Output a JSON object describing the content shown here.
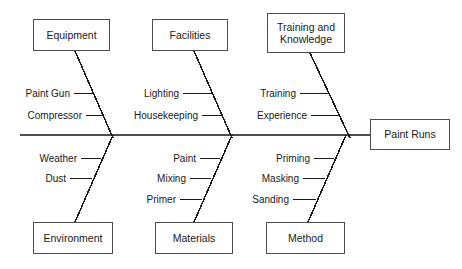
{
  "diagram": {
    "type": "fishbone-ishikawa",
    "effect": {
      "label": "Paint Runs"
    },
    "spine": {
      "x_start": 20,
      "x_end": 370,
      "y": 135
    },
    "colors": {
      "line": "#4d4d4d",
      "bone": "#1a1a1a",
      "text": "#1a1a1a",
      "background": "#ffffff"
    },
    "categories": [
      {
        "id": "equipment",
        "label": "Equipment",
        "side": "top",
        "box": {
          "x": 33,
          "y": 19,
          "w": 77,
          "h": 32
        },
        "bone": {
          "x1": 75,
          "y1": 51,
          "x2": 113,
          "y2": 138
        },
        "causes": [
          {
            "label": "Paint Gun",
            "text_x": 70,
            "y": 93,
            "line_x1": 74,
            "line_x2": 94
          },
          {
            "label": "Compressor",
            "text_x": 82,
            "y": 115,
            "line_x1": 86,
            "line_x2": 103
          }
        ]
      },
      {
        "id": "facilities",
        "label": "Facilities",
        "side": "top",
        "box": {
          "x": 152,
          "y": 19,
          "w": 76,
          "h": 32
        },
        "bone": {
          "x1": 194,
          "y1": 51,
          "x2": 232,
          "y2": 138
        },
        "causes": [
          {
            "label": "Lighting",
            "text_x": 179,
            "y": 93,
            "line_x1": 183,
            "line_x2": 213
          },
          {
            "label": "Housekeeping",
            "text_x": 198,
            "y": 115,
            "line_x1": 202,
            "line_x2": 222
          }
        ]
      },
      {
        "id": "training-and-knowledge",
        "label": "Training and Knowledge",
        "side": "top",
        "box": {
          "x": 267,
          "y": 13,
          "w": 78,
          "h": 40
        },
        "bone": {
          "x1": 310,
          "y1": 53,
          "x2": 350,
          "y2": 138
        },
        "causes": [
          {
            "label": "Training",
            "text_x": 296,
            "y": 93,
            "line_x1": 300,
            "line_x2": 329
          },
          {
            "label": "Experience",
            "text_x": 307,
            "y": 115,
            "line_x1": 311,
            "line_x2": 339
          }
        ]
      },
      {
        "id": "environment",
        "label": "Environment",
        "side": "bottom",
        "box": {
          "x": 33,
          "y": 222,
          "w": 80,
          "h": 32
        },
        "bone": {
          "x1": 75,
          "y1": 222,
          "x2": 113,
          "y2": 135
        },
        "causes": [
          {
            "label": "Weather",
            "text_x": 77,
            "y": 158,
            "line_x1": 81,
            "line_x2": 101
          },
          {
            "label": "Dust",
            "text_x": 66,
            "y": 178,
            "line_x1": 70,
            "line_x2": 92
          }
        ]
      },
      {
        "id": "materials",
        "label": "Materials",
        "side": "bottom",
        "box": {
          "x": 155,
          "y": 222,
          "w": 78,
          "h": 32
        },
        "bone": {
          "x1": 194,
          "y1": 222,
          "x2": 232,
          "y2": 135
        },
        "causes": [
          {
            "label": "Paint",
            "text_x": 196,
            "y": 158,
            "line_x1": 200,
            "line_x2": 220
          },
          {
            "label": "Mixing",
            "text_x": 186,
            "y": 178,
            "line_x1": 190,
            "line_x2": 211
          },
          {
            "label": "Primer",
            "text_x": 176,
            "y": 199,
            "line_x1": 180,
            "line_x2": 202
          }
        ]
      },
      {
        "id": "method",
        "label": "Method",
        "side": "bottom",
        "box": {
          "x": 266,
          "y": 222,
          "w": 79,
          "h": 32
        },
        "bone": {
          "x1": 308,
          "y1": 222,
          "x2": 346,
          "y2": 135
        },
        "causes": [
          {
            "label": "Priming",
            "text_x": 310,
            "y": 158,
            "line_x1": 314,
            "line_x2": 334
          },
          {
            "label": "Masking",
            "text_x": 299,
            "y": 178,
            "line_x1": 303,
            "line_x2": 325
          },
          {
            "label": "Sanding",
            "text_x": 289,
            "y": 199,
            "line_x1": 293,
            "line_x2": 316
          }
        ]
      }
    ],
    "effect_box": {
      "x": 370,
      "y": 119,
      "w": 80,
      "h": 31
    }
  }
}
